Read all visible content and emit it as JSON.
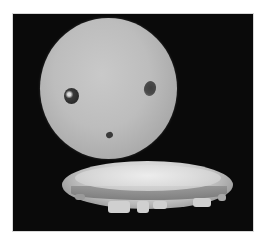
{
  "image": {
    "description": "Grayscale photograph of a pale sphere with two dark eye-like spots and a small mouth-like spot, floating above a shallow bright dish with an irregular bottom edge, on a black background",
    "background_color": "#0a0a0a",
    "frame_color": "#ffffff",
    "subjects": [
      {
        "name": "sphere",
        "color": "#bdbdbd"
      },
      {
        "name": "left-eye-spot",
        "color": "#2a2a2a"
      },
      {
        "name": "right-eye-spot",
        "color": "#4a4a4a"
      },
      {
        "name": "mouth-spot",
        "color": "#3a3a3a"
      },
      {
        "name": "dish",
        "color": "#d6d6d6"
      }
    ]
  }
}
